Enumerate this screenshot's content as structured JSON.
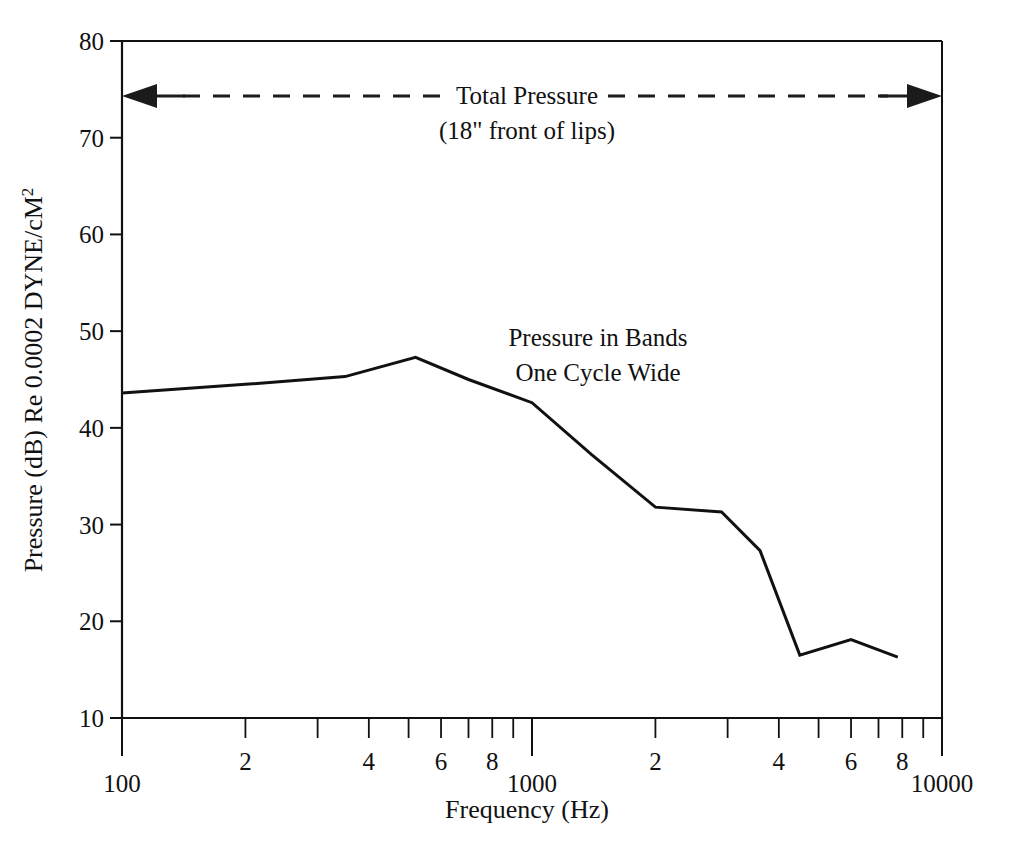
{
  "chart_data": {
    "type": "line",
    "title": "",
    "xlabel": "Frequency (Hz)",
    "ylabel": "Pressure (dB) Re 0.0002 DYNE/cM",
    "ylabel_superscript": "2",
    "xscale": "log",
    "yscale": "linear",
    "xlim": [
      100,
      10000
    ],
    "ylim": [
      10,
      80
    ],
    "grid": false,
    "legend": "none",
    "x_major_ticks": [
      100,
      1000,
      10000
    ],
    "x_major_tick_labels": [
      "100",
      "1000",
      "10000"
    ],
    "x_minor_tick_values": [
      200,
      300,
      400,
      500,
      600,
      700,
      800,
      900,
      2000,
      3000,
      4000,
      5000,
      6000,
      7000,
      8000,
      9000
    ],
    "x_minor_tick_labels": [
      "2",
      "",
      "4",
      "",
      "6",
      "",
      "8",
      "",
      "2",
      "",
      "4",
      "",
      "6",
      "",
      "8",
      ""
    ],
    "y_ticks": [
      10,
      20,
      30,
      40,
      50,
      60,
      70,
      80
    ],
    "y_tick_labels": [
      "10",
      "20",
      "30",
      "40",
      "50",
      "60",
      "70",
      "80"
    ],
    "series": [
      {
        "name": "Pressure in Bands One Cycle Wide",
        "color": "#111111",
        "x": [
          100,
          200,
          350,
          520,
          700,
          1000,
          1400,
          2000,
          2900,
          3600,
          4500,
          6000,
          7800
        ],
        "y": [
          43.6,
          44.5,
          45.3,
          47.3,
          45.0,
          42.6,
          37.2,
          31.8,
          31.3,
          27.3,
          16.5,
          18.1,
          16.3
        ]
      }
    ],
    "annotations": [
      {
        "name": "total-pressure",
        "text_line1": "Total Pressure",
        "text_line2": "(18\" front of lips)",
        "y_value": 75,
        "x_start": 100,
        "x_end": 10000,
        "style": "double-headed-dashed-arrow"
      },
      {
        "name": "pressure-in-bands",
        "text_line1": "Pressure in Bands",
        "text_line2": "One Cycle Wide",
        "x_value": 900,
        "y_value": 49,
        "style": "plain-text"
      }
    ]
  },
  "colors": {
    "ink": "#111111",
    "background": "#ffffff"
  }
}
